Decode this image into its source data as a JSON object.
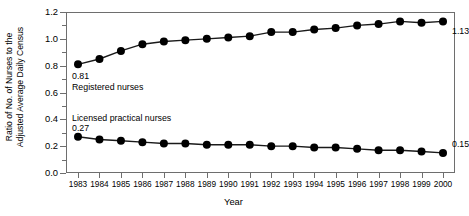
{
  "chart_data": {
    "type": "line",
    "title": "",
    "xlabel": "Year",
    "ylabel": "Ratio of No. of Nurses to the Adjusted Average Daily Census",
    "ylabel_lines": [
      "Ratio of No. of Nurses to the",
      "Adjusted Average Daily Census"
    ],
    "x": [
      1983,
      1984,
      1985,
      1986,
      1987,
      1988,
      1989,
      1990,
      1991,
      1992,
      1993,
      1994,
      1995,
      1996,
      1997,
      1998,
      1999,
      2000
    ],
    "xtick_labels": [
      "1983",
      "1984",
      "1985",
      "1986",
      "1987",
      "1988",
      "1989",
      "1990",
      "1991",
      "1992",
      "1993",
      "1994",
      "1995",
      "1996",
      "1997",
      "1998",
      "1999",
      "2000"
    ],
    "ytick_labels": [
      "0.0",
      "0.2",
      "0.4",
      "0.6",
      "0.8",
      "1.0",
      "1.2"
    ],
    "ytick_values": [
      0.0,
      0.2,
      0.4,
      0.6,
      0.8,
      1.0,
      1.2
    ],
    "yminor_values": [
      0.1,
      0.3,
      0.5,
      0.7,
      0.9,
      1.1
    ],
    "ylim": [
      0.0,
      1.2
    ],
    "xlim": [
      1982.5,
      2000.5
    ],
    "grid": false,
    "legend": "none (inline annotations)",
    "marker": "filled-circle",
    "series": [
      {
        "name": "Registered nurses",
        "values": [
          0.81,
          0.85,
          0.91,
          0.96,
          0.98,
          0.99,
          1.0,
          1.01,
          1.02,
          1.05,
          1.05,
          1.07,
          1.08,
          1.1,
          1.11,
          1.13,
          1.12,
          1.13
        ],
        "color": "#000000",
        "start_label": "0.81",
        "end_label": "1.13"
      },
      {
        "name": "Licensed practical nurses",
        "values": [
          0.27,
          0.25,
          0.24,
          0.23,
          0.22,
          0.22,
          0.21,
          0.21,
          0.21,
          0.2,
          0.2,
          0.19,
          0.19,
          0.18,
          0.17,
          0.17,
          0.16,
          0.15
        ],
        "color": "#000000",
        "start_label": "0.27",
        "end_label": "0.15"
      }
    ],
    "annotations": [
      {
        "text": "0.81",
        "series": "Registered nurses",
        "kind": "start-value"
      },
      {
        "text": "Registered nurses",
        "series": "Registered nurses",
        "kind": "series-name"
      },
      {
        "text": "1.13",
        "series": "Registered nurses",
        "kind": "end-value"
      },
      {
        "text": "Licensed practical nurses",
        "series": "Licensed practical nurses",
        "kind": "series-name"
      },
      {
        "text": "0.27",
        "series": "Licensed practical nurses",
        "kind": "start-value"
      },
      {
        "text": "0.15",
        "series": "Licensed practical nurses",
        "kind": "end-value"
      }
    ]
  },
  "axis": {
    "frame_color": "#6e6e6e",
    "line_color": "#1a1a1a",
    "marker_color": "#000000"
  }
}
